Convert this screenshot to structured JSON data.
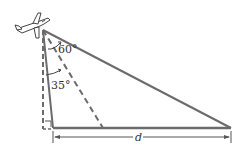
{
  "diagram": {
    "type": "geometry",
    "labels": {
      "angle_top": "60°",
      "angle_mid": "35°",
      "distance": "d"
    },
    "colors": {
      "line": "#6b6b6b",
      "dash": "#6b6b6b",
      "text": "#333333",
      "background": "#ffffff"
    }
  }
}
